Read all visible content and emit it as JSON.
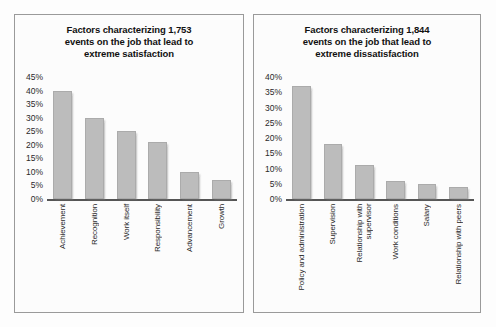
{
  "figure": {
    "background_color": "#fdfdfd",
    "panel_border_color": "#9a9a9a",
    "bar_color": "#bcbcbc",
    "axis_color": "#555555"
  },
  "charts": [
    {
      "panel_name": "satisfaction-panel",
      "title": "Factors characterizing 1,753\nevents on the job that lead to\nextreme satisfaction",
      "yticks": [
        "45%",
        "40%",
        "35%",
        "30%",
        "25%",
        "20%",
        "15%",
        "10%",
        "5%",
        "0%"
      ],
      "categories": [
        "Achievement",
        "Recognition",
        "Work itself",
        "Responsibility",
        "Advancement",
        "Growth"
      ],
      "values": [
        40,
        30,
        25,
        21,
        10,
        7
      ]
    },
    {
      "panel_name": "dissatisfaction-panel",
      "title": "Factors characterizing 1,844\nevents on the job that lead to\nextreme dissatisfaction",
      "yticks": [
        "40%",
        "35%",
        "30%",
        "25%",
        "20%",
        "15%",
        "10%",
        "5%",
        "0%"
      ],
      "categories": [
        "Policy and administration",
        "Supervision",
        "Relationship with\nsupervisor",
        "Work conditions",
        "Salary",
        "Relationship with peers"
      ],
      "values": [
        37,
        18,
        11,
        6,
        5,
        4
      ]
    }
  ],
  "chart_data": [
    {
      "type": "bar",
      "title": "Factors characterizing 1,753 events on the job that lead to extreme satisfaction",
      "xlabel": "",
      "ylabel": "",
      "categories": [
        "Achievement",
        "Recognition",
        "Work itself",
        "Responsibility",
        "Advancement",
        "Growth"
      ],
      "values": [
        40,
        30,
        25,
        21,
        10,
        7
      ],
      "ylim": [
        0,
        45
      ],
      "ytick_values": [
        0,
        5,
        10,
        15,
        20,
        25,
        30,
        35,
        40,
        45
      ],
      "ytick_labels": [
        "0%",
        "5%",
        "10%",
        "15%",
        "20%",
        "25%",
        "30%",
        "35%",
        "40%",
        "45%"
      ],
      "grid": false,
      "legend": "none",
      "units": "percent of events"
    },
    {
      "type": "bar",
      "title": "Factors characterizing 1,844 events on the job that lead to extreme dissatisfaction",
      "xlabel": "",
      "ylabel": "",
      "categories": [
        "Policy and administration",
        "Supervision",
        "Relationship with supervisor",
        "Work conditions",
        "Salary",
        "Relationship with peers"
      ],
      "values": [
        37,
        18,
        11,
        6,
        5,
        4
      ],
      "ylim": [
        0,
        40
      ],
      "ytick_values": [
        0,
        5,
        10,
        15,
        20,
        25,
        30,
        35,
        40
      ],
      "ytick_labels": [
        "0%",
        "5%",
        "10%",
        "15%",
        "20%",
        "25%",
        "30%",
        "35%",
        "40%"
      ],
      "grid": false,
      "legend": "none",
      "units": "percent of events"
    }
  ]
}
